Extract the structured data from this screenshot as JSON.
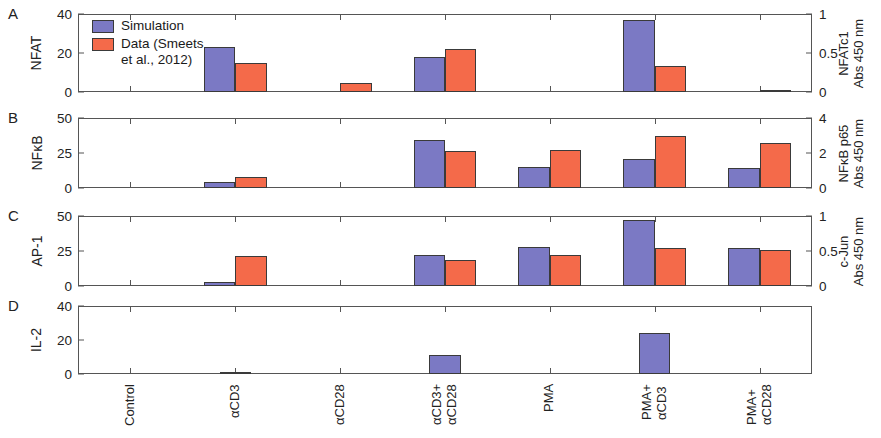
{
  "figure": {
    "colors": {
      "simulation": "#7b79c4",
      "data": "#f46a4a",
      "axis": "#555555",
      "text": "#1a1a1a"
    },
    "legend": {
      "items": [
        {
          "key": "simulation",
          "label": "Simulation"
        },
        {
          "key": "data",
          "label": "Data (Smeets\net al., 2012)"
        }
      ]
    },
    "panel_letters": [
      "A",
      "B",
      "C",
      "D"
    ],
    "categories": [
      {
        "line1": "Control",
        "line2": ""
      },
      {
        "line1": "αCD3",
        "line2": ""
      },
      {
        "line1": "αCD28",
        "line2": ""
      },
      {
        "line1": "αCD3+",
        "line2": "αCD28"
      },
      {
        "line1": "PMA",
        "line2": ""
      },
      {
        "line1": "PMA+",
        "line2": "αCD3"
      },
      {
        "line1": "PMA+",
        "line2": "αCD28"
      }
    ]
  },
  "chart_data": [
    {
      "type": "bar",
      "panel": "A",
      "title": "",
      "ylabel": "NFAT",
      "ylabel_right": "NFATc1\nAbs 450 nm",
      "xlabel": "",
      "ylim": [
        0,
        40
      ],
      "yticks": [
        0,
        20,
        40
      ],
      "ylim_right": [
        0,
        1
      ],
      "yticks_right": [
        0,
        0.5,
        1
      ],
      "grid": false,
      "legend_position": "top-left",
      "categories": [
        "Control",
        "αCD3",
        "αCD28",
        "αCD3+αCD28",
        "PMA",
        "PMA+αCD3",
        "PMA+αCD28"
      ],
      "series": [
        {
          "name": "Simulation",
          "values": [
            0,
            23,
            0,
            18,
            0,
            37,
            0
          ]
        },
        {
          "name": "Data (Smeets et al., 2012)",
          "values": [
            0,
            0.37,
            0.12,
            0.55,
            0,
            0.33,
            0.01
          ]
        }
      ]
    },
    {
      "type": "bar",
      "panel": "B",
      "title": "",
      "ylabel": "NFκB",
      "ylabel_right": "NFκB p65\nAbs 450 nm",
      "xlabel": "",
      "ylim": [
        0,
        50
      ],
      "yticks": [
        0,
        25,
        50
      ],
      "ylim_right": [
        0,
        4
      ],
      "yticks_right": [
        0,
        2,
        4
      ],
      "grid": false,
      "legend_position": "none",
      "categories": [
        "Control",
        "αCD3",
        "αCD28",
        "αCD3+αCD28",
        "PMA",
        "PMA+αCD3",
        "PMA+αCD28"
      ],
      "series": [
        {
          "name": "Simulation",
          "values": [
            0,
            4,
            0,
            34,
            15,
            21,
            14
          ]
        },
        {
          "name": "Data (Smeets et al., 2012)",
          "values": [
            0,
            0.65,
            0,
            2.1,
            2.2,
            2.95,
            2.6
          ]
        }
      ]
    },
    {
      "type": "bar",
      "panel": "C",
      "title": "",
      "ylabel": "AP-1",
      "ylabel_right": "c-Jun\nAbs 450 nm",
      "xlabel": "",
      "ylim": [
        0,
        50
      ],
      "yticks": [
        0,
        25,
        50
      ],
      "ylim_right": [
        0,
        1
      ],
      "yticks_right": [
        0,
        0.5,
        1
      ],
      "grid": false,
      "legend_position": "none",
      "categories": [
        "Control",
        "αCD3",
        "αCD28",
        "αCD3+αCD28",
        "PMA",
        "PMA+αCD3",
        "PMA+αCD28"
      ],
      "series": [
        {
          "name": "Simulation",
          "values": [
            0,
            3,
            0,
            22,
            28,
            47,
            27
          ]
        },
        {
          "name": "Data (Smeets et al., 2012)",
          "values": [
            0,
            0.43,
            0,
            0.37,
            0.45,
            0.55,
            0.52
          ]
        }
      ]
    },
    {
      "type": "bar",
      "panel": "D",
      "title": "",
      "ylabel": "IL-2",
      "ylabel_right": "",
      "xlabel": "",
      "ylim": [
        0,
        40
      ],
      "yticks": [
        0,
        20,
        40
      ],
      "grid": false,
      "legend_position": "none",
      "categories": [
        "Control",
        "αCD3",
        "αCD28",
        "αCD3+αCD28",
        "PMA",
        "PMA+αCD3",
        "PMA+αCD28"
      ],
      "series": [
        {
          "name": "Simulation",
          "values": [
            0,
            0.5,
            0,
            11,
            0,
            24,
            0
          ]
        }
      ]
    }
  ]
}
